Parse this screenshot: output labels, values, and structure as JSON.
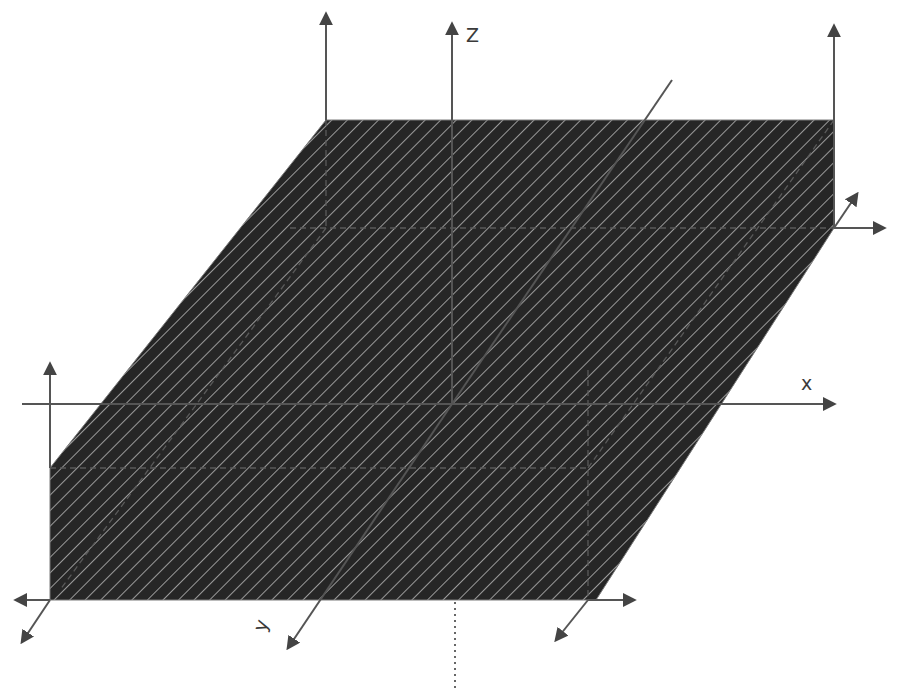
{
  "diagram": {
    "labels": {
      "z": "Z",
      "x": "x",
      "y": "y"
    },
    "colors": {
      "background": "#ffffff",
      "plane_fill": "#262626",
      "hatch_line": "#b8b8b8",
      "axis_stroke": "#555555",
      "interior_line": "#5a5a5a",
      "arrowhead": "#444444"
    },
    "plane": {
      "shape": "parallelogram",
      "vertices": [
        [
          50,
          600
        ],
        [
          50,
          468
        ],
        [
          326,
          120
        ],
        [
          834,
          120
        ],
        [
          834,
          228
        ],
        [
          596,
          600
        ]
      ],
      "hatch": "diagonal stripes, top-left to bottom-right, ~11px spacing"
    },
    "axes": {
      "z_axis": {
        "from": [
          452,
          404
        ],
        "to": [
          452,
          22
        ],
        "label": "Z"
      },
      "x_axis": {
        "from": [
          22,
          404
        ],
        "to": [
          836,
          404
        ],
        "label": "x"
      },
      "y_axis": {
        "from": [
          672,
          80
        ],
        "to": [
          286,
          650
        ],
        "label": "y"
      },
      "vertical_guide_dotted": {
        "from": [
          455,
          600
        ],
        "to": [
          455,
          688
        ]
      }
    },
    "corner_frames": [
      {
        "name": "top-left",
        "origin": [
          326,
          120
        ],
        "arrows": [
          "up"
        ]
      },
      {
        "name": "top-right",
        "origin": [
          834,
          228
        ],
        "arrows": [
          "up",
          "right",
          "diagonal-up-right"
        ]
      },
      {
        "name": "left",
        "origin": [
          50,
          468
        ],
        "arrows": [
          "up"
        ]
      },
      {
        "name": "bottom-left",
        "origin": [
          50,
          600
        ],
        "arrows": [
          "left",
          "diagonal-down-left"
        ]
      },
      {
        "name": "bottom-right",
        "origin": [
          588,
          600
        ],
        "arrows": [
          "right",
          "diagonal-down-left"
        ]
      }
    ]
  }
}
